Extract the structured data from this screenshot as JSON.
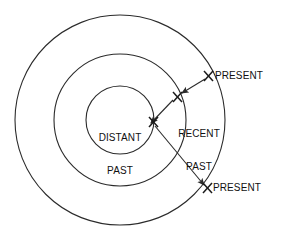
{
  "diagram": {
    "background_color": "#ffffff",
    "stroke_color": "#2b2b2b",
    "text_color": "#111111",
    "center": {
      "x": 120,
      "y": 120
    },
    "rings": [
      {
        "name": "outer-ring",
        "radius": 105
      },
      {
        "name": "middle-ring",
        "radius": 66
      },
      {
        "name": "inner-ring",
        "radius": 34
      }
    ],
    "labels": {
      "distant_past": "DISTANT\nPAST",
      "distant_past_line1": "DISTANT",
      "distant_past_line2": "PAST",
      "recent_past": "RECENT\nPAST",
      "recent_past_line1": "RECENT",
      "recent_past_line2": "PAST",
      "present_top": "PRESENT",
      "present_bottom": "PRESENT"
    },
    "markers": [
      {
        "name": "x-marker-present-top",
        "symbol": "X",
        "x": 209,
        "y": 76
      },
      {
        "name": "x-marker-recent-past",
        "symbol": "X",
        "x": 177,
        "y": 97
      },
      {
        "name": "x-marker-distant-past",
        "symbol": "X",
        "x": 153,
        "y": 122
      },
      {
        "name": "x-marker-present-bottom",
        "symbol": "X",
        "x": 208,
        "y": 188
      }
    ],
    "connectors": [
      {
        "name": "arrow-present-top-to-recent-past",
        "from": [
          205,
          79
        ],
        "to": [
          181,
          93
        ]
      },
      {
        "name": "arrow-recent-past-to-distant-past",
        "from": [
          173,
          100
        ],
        "to": [
          150,
          124
        ]
      },
      {
        "name": "arrow-distant-past-to-present-bottom",
        "from": [
          155,
          126
        ],
        "to": [
          205,
          186
        ]
      }
    ]
  }
}
